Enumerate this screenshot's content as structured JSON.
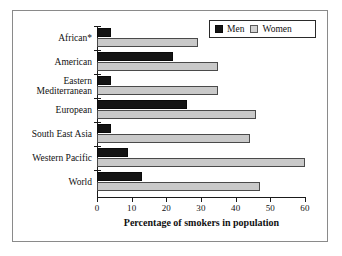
{
  "chart_data": {
    "type": "bar",
    "orientation": "horizontal",
    "title": "",
    "xlabel": "Percentage of smokers in population",
    "ylabel": "",
    "xlim": [
      0,
      60
    ],
    "xticks": [
      0,
      10,
      20,
      30,
      40,
      50,
      60
    ],
    "grid": false,
    "legend_position": "top-right",
    "categories": [
      "African*",
      "American",
      "Eastern\nMediterranean",
      "European",
      "South East Asia",
      "Western Pacific",
      "World"
    ],
    "series": [
      {
        "name": "Men",
        "color": "#141414",
        "values": [
          4,
          22,
          4,
          26,
          4,
          9,
          13
        ]
      },
      {
        "name": "Women",
        "color": "#c9c9c9",
        "values": [
          29,
          35,
          35,
          46,
          44,
          60,
          47
        ]
      }
    ]
  },
  "legend": {
    "entries": [
      {
        "label": "Men"
      },
      {
        "label": "Women"
      }
    ]
  }
}
